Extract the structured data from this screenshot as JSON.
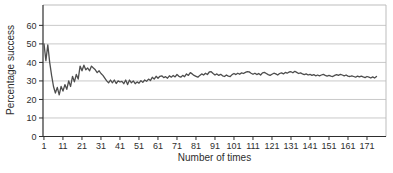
{
  "chart_data": {
    "type": "line",
    "title": "",
    "xlabel": "Number of times",
    "ylabel": "Percentage success",
    "x_start": 1,
    "x_step": 1,
    "xlim": [
      0.5,
      181
    ],
    "ylim": [
      0,
      71
    ],
    "x_ticks": [
      1,
      11,
      21,
      31,
      41,
      51,
      61,
      71,
      81,
      91,
      101,
      111,
      121,
      131,
      141,
      151,
      161,
      171
    ],
    "y_ticks": [
      0,
      10,
      20,
      30,
      40,
      50,
      60
    ],
    "grid": "horizontal",
    "legend": "none",
    "colors": {
      "line": "#4d4d4d",
      "grid": "#c9c9c9",
      "border": "#bdbdbd",
      "axis": "#2e2e2e",
      "text": "#2e2e2e",
      "background": "#ffffff"
    },
    "values": [
      50,
      41,
      49.5,
      40,
      33,
      27,
      23.5,
      26.5,
      22.5,
      27,
      24.5,
      28,
      25.5,
      30,
      27,
      32.5,
      29.5,
      33.5,
      31,
      38,
      35.5,
      38.5,
      36,
      37,
      35.5,
      38,
      37,
      36,
      34.5,
      35.5,
      34,
      33,
      31.5,
      30,
      29,
      30.5,
      29,
      30.5,
      28.6,
      30,
      29.4,
      29.8,
      28.5,
      30.5,
      28,
      30.5,
      29,
      30,
      28.5,
      29.5,
      28.8,
      30.2,
      29.2,
      30.5,
      29.8,
      31,
      30.2,
      32,
      31,
      32.5,
      31.5,
      32.5,
      32.8,
      31.8,
      32.3,
      31.5,
      32.8,
      32,
      33,
      32.2,
      33.5,
      32.5,
      32,
      33,
      32.3,
      33.8,
      33,
      34.5,
      33.8,
      33,
      32.5,
      32,
      33,
      33.8,
      33.2,
      34.2,
      33.5,
      34.8,
      35,
      34,
      33.2,
      33.8,
      33,
      33.6,
      32.8,
      32.4,
      33.2,
      32.6,
      32.4,
      33.4,
      34,
      33.4,
      34.2,
      33.6,
      34.4,
      34,
      34.6,
      35,
      34.9,
      34.2,
      33.6,
      34.2,
      33.4,
      34,
      33.2,
      34.4,
      34.6,
      34,
      33.4,
      33,
      33.6,
      34.2,
      33.8,
      33.2,
      34,
      34.4,
      33.8,
      34.6,
      34.2,
      34.8,
      35,
      34.4,
      35.2,
      34.6,
      34,
      34.4,
      33.8,
      33.4,
      33.8,
      33.2,
      33.6,
      33,
      33.4,
      32.8,
      33.2,
      32.8,
      33.2,
      33.6,
      33,
      32.6,
      33,
      32.6,
      32.4,
      33,
      33.4,
      33,
      33.6,
      33.2,
      32.8,
      33.2,
      32.6,
      32.4,
      32.8,
      32.4,
      32,
      32.6,
      32.2,
      32.6,
      32.2,
      31.8,
      32.4,
      32,
      31.6,
      32.2,
      31.6,
      32.4
    ]
  }
}
